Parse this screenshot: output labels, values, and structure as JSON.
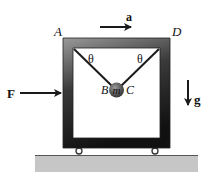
{
  "diagram": {
    "labels": {
      "corner_a": "A",
      "corner_d": "D",
      "accel": "a",
      "force": "F",
      "gravity": "g",
      "theta_left": "θ",
      "theta_right": "θ",
      "point_b": "B",
      "point_c": "C",
      "mass": "m"
    },
    "colors": {
      "frame_dark": "#1e1e1e",
      "frame_light": "#8a8a8a",
      "ground": "#c4c4c4",
      "ground_edge": "#555555",
      "ball": "#5a5a5a",
      "line": "#1a1a1a"
    }
  }
}
